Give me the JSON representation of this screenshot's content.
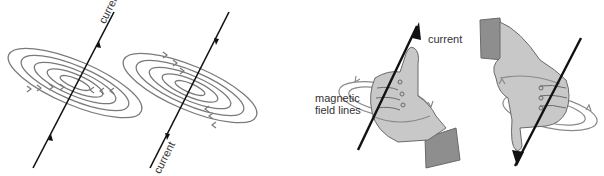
{
  "diagram": {
    "panels": [
      {
        "id": "wire-up",
        "label": "current",
        "direction": "up",
        "field_rotation": "anticlockwise"
      },
      {
        "id": "wire-down",
        "label": "current",
        "direction": "down",
        "field_rotation": "clockwise"
      },
      {
        "id": "hand-up",
        "labels": [
          "current",
          "magnetic field lines"
        ]
      },
      {
        "id": "hand-down",
        "labels": []
      }
    ],
    "labels": {
      "current_1": "current",
      "current_2": "current",
      "current_3": "current",
      "field_lines_1": "magnetic",
      "field_lines_2": "field lines"
    },
    "colors": {
      "wire": "#111111",
      "field_line": "#7a7a7a",
      "hand_fill": "#c8c8c8",
      "sleeve_fill": "#8e8e8e",
      "outline": "#6a6a6a"
    }
  }
}
